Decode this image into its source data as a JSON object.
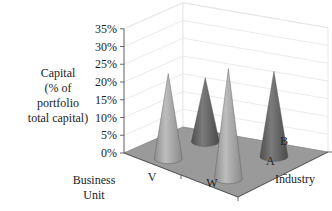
{
  "chart_data": {
    "type": "bar",
    "subtype": "3d-cone",
    "title": "",
    "zlabel": "Capital (% of portfolio total capital)",
    "zlabel_lines": [
      "Capital",
      "(% of",
      "portfolio",
      "total capital)"
    ],
    "xlabel": "Business Unit",
    "xlabel_lines": [
      "Business",
      "Unit"
    ],
    "ylabel": "Industry",
    "x_categories": [
      "V",
      "W"
    ],
    "y_categories": [
      "A",
      "B"
    ],
    "z_ticks": [
      "0%",
      "5%",
      "10%",
      "15%",
      "20%",
      "25%",
      "30%",
      "35%"
    ],
    "zlim": [
      0,
      35
    ],
    "grid": true,
    "series": [
      {
        "name": "A",
        "values": [
          24,
          31
        ],
        "color": "#a6a6a6"
      },
      {
        "name": "B",
        "values": [
          18,
          24
        ],
        "color": "#6e6e6e"
      }
    ],
    "floor_color": "#9a9a9a"
  }
}
